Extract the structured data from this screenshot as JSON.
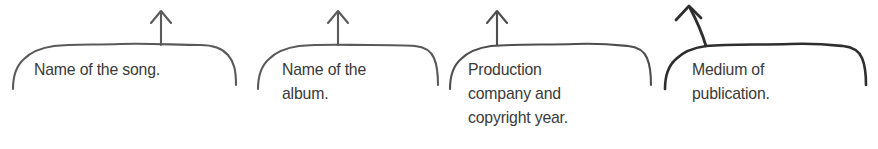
{
  "figure": {
    "type": "annotated-brace-callouts",
    "background_color": "#ffffff",
    "ink_color": "#555555",
    "ink_color_emphasis": "#2a2a2a",
    "text_color": "#3a3a3a",
    "callouts": [
      {
        "id": "song",
        "label": "Name of the song.",
        "arrow": "up-arrow-icon",
        "arrow_style": "vertical"
      },
      {
        "id": "album",
        "label": "Name of the\nalbum.",
        "arrow": "up-arrow-icon",
        "arrow_style": "vertical"
      },
      {
        "id": "company",
        "label": "Production\ncompany and\ncopyright year.",
        "arrow": "up-arrow-icon",
        "arrow_style": "vertical"
      },
      {
        "id": "medium",
        "label": "Medium of\npublication.",
        "arrow": "up-left-arrow-icon",
        "arrow_style": "diagonal"
      }
    ]
  }
}
